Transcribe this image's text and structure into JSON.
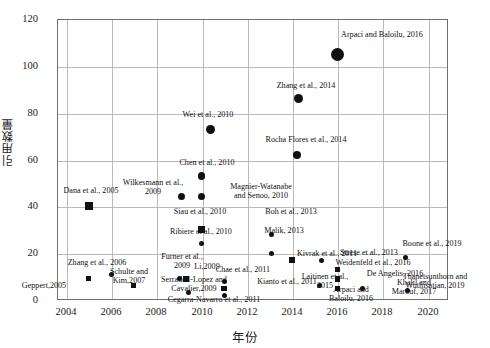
{
  "chart_data": {
    "type": "scatter",
    "title": "",
    "xlabel": "年份",
    "ylabel": "引用数量",
    "xlim": [
      2003.6,
      2020.9
    ],
    "ylim": [
      0,
      120
    ],
    "xticks": [
      2004,
      2006,
      2008,
      2010,
      2012,
      2014,
      2016,
      2018,
      2020
    ],
    "yticks": [
      0,
      20,
      40,
      60,
      80,
      100,
      120
    ],
    "grid": true,
    "legend": "none",
    "marker_colors": {
      "fill": "#111111"
    },
    "points": [
      {
        "label": "Arpaci and Baloilu, 2016",
        "x": 2016.0,
        "y": 105,
        "marker": "circle",
        "size": 13,
        "lx": 316,
        "ly": 30,
        "lw": 132,
        "align": "c"
      },
      {
        "label": "Zhang et al., 2014",
        "x": 2014.3,
        "y": 86,
        "marker": "circle",
        "size": 9,
        "lx": 258,
        "ly": 81,
        "lw": 96,
        "align": "c"
      },
      {
        "label": "Rocha Flores et al., 2014",
        "x": 2014.2,
        "y": 62,
        "marker": "circle",
        "size": 8,
        "lx": 244,
        "ly": 135,
        "lw": 124,
        "align": "c"
      },
      {
        "label": "Wei et al., 2010",
        "x": 2010.4,
        "y": 73,
        "marker": "circle",
        "size": 9,
        "lx": 166,
        "ly": 110,
        "lw": 84,
        "align": "c"
      },
      {
        "label": "Chen et al., 2010",
        "x": 2010.0,
        "y": 53,
        "marker": "circle",
        "size": 7.5,
        "lx": 163,
        "ly": 158,
        "lw": 88,
        "align": "c"
      },
      {
        "label": "Wilkesmann et al.,\n2009",
        "x": 2009.1,
        "y": 44,
        "marker": "circle",
        "size": 7,
        "lx": 111,
        "ly": 178,
        "lw": 84,
        "align": "c"
      },
      {
        "label": "Magnier-Watanabe\nand Senoo, 2010",
        "x": 2010.0,
        "y": 44,
        "marker": "circle",
        "size": 7,
        "lx": 213,
        "ly": 182,
        "lw": 96,
        "align": "c"
      },
      {
        "label": "Dana et al., 2005",
        "x": 2005.0,
        "y": 40,
        "marker": "square",
        "size": 8,
        "lx": 48,
        "ly": 186,
        "lw": 86,
        "align": "c"
      },
      {
        "label": "Siau et al., 2010",
        "x": 2010.0,
        "y": 30,
        "marker": "square",
        "size": 7,
        "lx": 158,
        "ly": 207,
        "lw": 84,
        "align": "c"
      },
      {
        "label": "Boh et al., 2013",
        "x": 2013.1,
        "y": 28,
        "marker": "circle",
        "size": 5.5,
        "lx": 250,
        "ly": 207,
        "lw": 82,
        "align": "c"
      },
      {
        "label": "Ribiere et al., 2010",
        "x": 2010.0,
        "y": 24,
        "marker": "circle",
        "size": 5,
        "lx": 154,
        "ly": 227,
        "lw": 94,
        "align": "c"
      },
      {
        "label": "Malik, 2013",
        "x": 2013.1,
        "y": 20,
        "marker": "circle",
        "size": 5,
        "lx": 251,
        "ly": 226,
        "lw": 66,
        "align": "c"
      },
      {
        "label": "Kivrak et al., 2011",
        "x": 2014.0,
        "y": 17,
        "marker": "square",
        "size": 6,
        "lx": 281,
        "ly": 249,
        "lw": 92,
        "align": "c"
      },
      {
        "label": "Strese et al., 2013",
        "x": 2015.3,
        "y": 17,
        "marker": "circle",
        "size": 5,
        "lx": 325,
        "ly": 248,
        "lw": 88,
        "align": "c"
      },
      {
        "label": "Boone et al., 2019",
        "x": 2019.0,
        "y": 18,
        "marker": "circle",
        "size": 5,
        "lx": 387,
        "ly": 239,
        "lw": 90,
        "align": "c"
      },
      {
        "label": "Zhang et al., 2006",
        "x": 2006.0,
        "y": 11,
        "marker": "circle",
        "size": 5,
        "lx": 51,
        "ly": 258,
        "lw": 92,
        "align": "c"
      },
      {
        "label": "Geppert,2005",
        "x": 2005.0,
        "y": 9,
        "marker": "square",
        "size": 5,
        "lx": 8,
        "ly": 281,
        "lw": 72,
        "align": "c"
      },
      {
        "label": "Schulte and\nKim,2007",
        "x": 2007.0,
        "y": 6,
        "marker": "square",
        "size": 5,
        "lx": 98,
        "ly": 267,
        "lw": 62,
        "align": "c"
      },
      {
        "label": "Furner et al.,\n2009",
        "x": 2009.0,
        "y": 9,
        "marker": "circle",
        "size": 5,
        "lx": 153,
        "ly": 252,
        "lw": 58,
        "align": "c"
      },
      {
        "label": "Li,2009",
        "x": 2009.3,
        "y": 9,
        "marker": "square",
        "size": 5.5,
        "lx": 186,
        "ly": 262,
        "lw": 42,
        "align": "c"
      },
      {
        "label": "Serradell-Lopez and\nCavalier,2009",
        "x": 2009.4,
        "y": 3,
        "marker": "circle",
        "size": 5,
        "lx": 144,
        "ly": 275,
        "lw": 100,
        "align": "c"
      },
      {
        "label": "Chae et al., 2011",
        "x": 2011.0,
        "y": 8,
        "marker": "circle",
        "size": 5,
        "lx": 201,
        "ly": 265,
        "lw": 84,
        "align": "c"
      },
      {
        "label": "Kianto et al., 2011",
        "x": 2011.0,
        "y": 5,
        "marker": "square",
        "size": 5.5,
        "lx": 243,
        "ly": 277,
        "lw": 88,
        "align": "c"
      },
      {
        "label": "Cegarra-Navarro et al., 2011",
        "x": 2011.0,
        "y": 2,
        "marker": "circle",
        "size": 5,
        "lx": 145,
        "ly": 295,
        "lw": 138,
        "align": "c"
      },
      {
        "label": "Laitinen et al.,\n2015",
        "x": 2015.2,
        "y": 6,
        "marker": "circle",
        "size": 5,
        "lx": 296,
        "ly": 272,
        "lw": 58,
        "align": "c"
      },
      {
        "label": "Weidenfeld et al., 2016",
        "x": 2016.0,
        "y": 13,
        "marker": "square",
        "size": 5.5,
        "lx": 318,
        "ly": 258,
        "lw": 110,
        "align": "c"
      },
      {
        "label": "De Angelis, 2016",
        "x": 2016.0,
        "y": 9,
        "marker": "square",
        "size": 5.5,
        "lx": 353,
        "ly": 269,
        "lw": 84,
        "align": "c"
      },
      {
        "label": "Arpaci and\nBaloilu, 2016",
        "x": 2016.0,
        "y": 5,
        "marker": "square",
        "size": 5.5,
        "lx": 316,
        "ly": 285,
        "lw": 70,
        "align": "c"
      },
      {
        "label": "Khalil and\nMarouf, 2017",
        "x": 2017.1,
        "y": 5,
        "marker": "circle",
        "size": 5,
        "lx": 383,
        "ly": 278,
        "lw": 62,
        "align": "c"
      },
      {
        "label": "Thanetsunthorn and\nWuthisatian, 2019",
        "x": 2019.1,
        "y": 4,
        "marker": "circle",
        "size": 5,
        "lx": 383,
        "ly": 272,
        "lw": 104,
        "align": "c"
      }
    ]
  }
}
